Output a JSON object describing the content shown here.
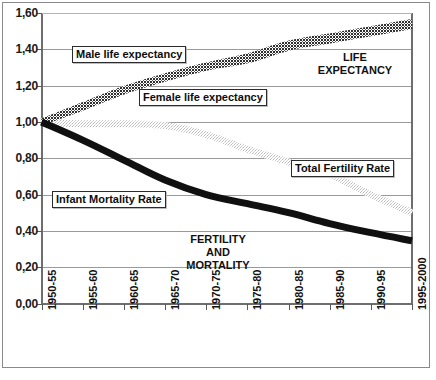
{
  "chart_data": {
    "type": "line",
    "title": "",
    "subtitle": "",
    "xlabel": "",
    "ylabel": "",
    "xlim": [
      0,
      9
    ],
    "ylim": [
      0.0,
      1.6
    ],
    "grid": true,
    "grid_axis": "y",
    "legend_position": "inline-callouts",
    "decimal_separator": ",",
    "categories": [
      "1950-55",
      "1955-60",
      "1960-65",
      "1965-70",
      "1970-75",
      "1975-80",
      "1980-85",
      "1985-90",
      "1990-95",
      "1995-2000"
    ],
    "y_ticks": [
      "0,00",
      "0,20",
      "0,40",
      "0,60",
      "0,80",
      "1,00",
      "1,20",
      "1,40",
      "1,60"
    ],
    "y_tick_values": [
      0.0,
      0.2,
      0.4,
      0.6,
      0.8,
      1.0,
      1.2,
      1.4,
      1.6
    ],
    "series": [
      {
        "name": "Male life expectancy",
        "style": "thick-hatched-dark",
        "color": "#3a3a3a",
        "values": [
          1.0,
          1.08,
          1.17,
          1.24,
          1.3,
          1.34,
          1.41,
          1.45,
          1.49,
          1.53
        ]
      },
      {
        "name": "Female life expectancy",
        "style": "thick-hatched-dark",
        "color": "#555555",
        "values": [
          1.0,
          1.09,
          1.18,
          1.25,
          1.31,
          1.36,
          1.43,
          1.47,
          1.51,
          1.55
        ]
      },
      {
        "name": "Total Fertility Rate",
        "style": "thick-dotted-light",
        "color": "#cfcfcf",
        "values": [
          1.0,
          0.99,
          0.99,
          0.98,
          0.93,
          0.85,
          0.78,
          0.71,
          0.6,
          0.5
        ]
      },
      {
        "name": "Infant Mortality Rate",
        "style": "thick-solid-black",
        "color": "#101010",
        "values": [
          1.0,
          0.9,
          0.79,
          0.68,
          0.6,
          0.55,
          0.5,
          0.44,
          0.39,
          0.345
        ]
      }
    ],
    "annotations": [
      {
        "text": "Male life expectancy",
        "kind": "boxed-callout"
      },
      {
        "text": "Female life expectancy",
        "kind": "boxed-callout"
      },
      {
        "text": "Total Fertility Rate",
        "kind": "boxed-callout"
      },
      {
        "text": "Infant Mortality Rate",
        "kind": "boxed-callout"
      },
      {
        "text": "LIFE EXPECTANCY",
        "kind": "region-label"
      },
      {
        "text": "FERTILITY AND MORTALITY",
        "kind": "region-label"
      }
    ]
  },
  "axis": {
    "y_labels": [
      "1,60",
      "1,40",
      "1,20",
      "1,00",
      "0,80",
      "0,60",
      "0,40",
      "0,20",
      "0,00"
    ],
    "x_labels": [
      "1950-55",
      "1955-60",
      "1960-65",
      "1965-70",
      "1970-75",
      "1975-80",
      "1980-85",
      "1985-90",
      "1990-95",
      "1995-2000"
    ]
  },
  "callouts": {
    "male": "Male life expectancy",
    "female": "Female life expectancy",
    "tfr": "Total Fertility Rate",
    "imr": "Infant Mortality Rate"
  },
  "region_notes": {
    "life_expectancy_line1": "LIFE",
    "life_expectancy_line2": "EXPECTANCY",
    "fert_mort_line1": "FERTILITY",
    "fert_mort_line2": "AND",
    "fert_mort_line3": "MORTALITY"
  },
  "colors": {
    "frame": "#8a8a8a",
    "axis": "#6e6e6e",
    "grid": "#9a9a9a",
    "life_expectancy": "#3a3a3a",
    "total_fertility_rate": "#cfcfcf",
    "infant_mortality_rate": "#101010",
    "text": "#111111",
    "background": "#ffffff"
  }
}
